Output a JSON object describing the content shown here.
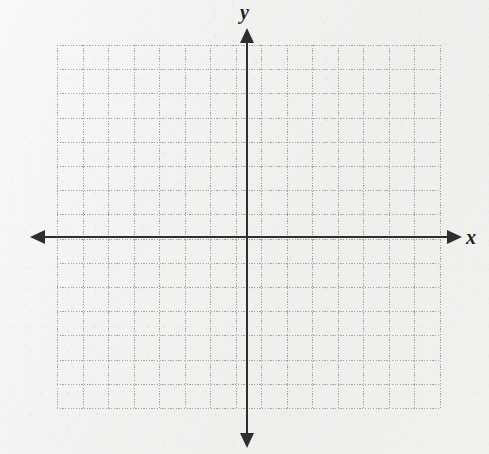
{
  "figure": {
    "kind": "blank-coordinate-grid",
    "media": "scanned-graph-paper",
    "background_color": "#f2f2f0",
    "grid_color": "#989896",
    "axis_color": "#2e2e2e"
  },
  "axes": {
    "x_label": "x",
    "y_label": "y",
    "x_arrow_left": "arrow-left-icon",
    "x_arrow_right": "arrow-right-icon",
    "y_arrow_up": "arrow-up-icon",
    "y_arrow_down": "arrow-down-icon"
  },
  "chart_data": {
    "type": "scatter",
    "title": "",
    "subtitle": "",
    "xlabel": "x",
    "ylabel": "y",
    "series": [
      {
        "name": "",
        "x": [],
        "y": []
      }
    ],
    "annotations": [],
    "legend": {
      "entries": [],
      "position": "none"
    },
    "grid": true,
    "grid_style": "dotted",
    "grid_cell_width_px": 25.5,
    "grid_cell_height_px": 24.2,
    "grid_columns": 15,
    "grid_rows": 15,
    "xlim": [
      -7.5,
      7.5
    ],
    "ylim": [
      -7,
      7
    ],
    "xticks": [
      -7,
      -6,
      -5,
      -4,
      -3,
      -2,
      -1,
      0,
      1,
      2,
      3,
      4,
      5,
      6,
      7
    ],
    "yticks": [
      -7,
      -6,
      -5,
      -4,
      -3,
      -2,
      -1,
      0,
      1,
      2,
      3,
      4,
      5,
      6,
      7
    ],
    "xticklabels": [],
    "yticklabels": [],
    "origin_px": [
      247,
      237
    ],
    "note": "Empty coordinate plane with no plotted data points or curves"
  }
}
